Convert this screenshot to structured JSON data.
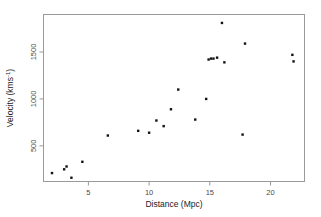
{
  "figure": {
    "background_color": "#ffffff",
    "frame_color": "#9a9a9a",
    "point_color": "#121212"
  },
  "axes": {
    "x_title": "Distance (Mpc)",
    "y_title": "Velocity (kms",
    "y_title_exponent": "-1",
    "y_title_close": ")",
    "x_ticks": [
      "5",
      "10",
      "15",
      "20"
    ],
    "y_ticks": [
      "500",
      "1000",
      "1500"
    ]
  },
  "chart_data": {
    "type": "scatter",
    "title": "",
    "xlabel": "Distance (Mpc)",
    "ylabel": "Velocity (kms^-1)",
    "xlim": [
      1.3,
      22.8
    ],
    "ylim": [
      120,
      1900
    ],
    "xticks": [
      5,
      10,
      15,
      20
    ],
    "yticks": [
      500,
      1000,
      1500
    ],
    "grid": false,
    "legend": false,
    "marker": "square",
    "marker_size": 2.4,
    "n_points": 24,
    "x": [
      2.0,
      3.0,
      3.2,
      3.6,
      4.5,
      6.6,
      9.1,
      10.0,
      10.6,
      11.2,
      11.8,
      12.4,
      13.8,
      14.7,
      14.9,
      15.1,
      15.6,
      16.0,
      16.2,
      17.7,
      17.9,
      21.8,
      21.9,
      15.3
    ],
    "y": [
      210,
      250,
      280,
      160,
      330,
      610,
      660,
      640,
      770,
      710,
      890,
      1100,
      780,
      1000,
      1420,
      1430,
      1440,
      1810,
      1390,
      620,
      1590,
      1470,
      1400,
      1430
    ],
    "series": [
      {
        "name": "galaxies",
        "points": [
          {
            "x": 2.0,
            "y": 210
          },
          {
            "x": 3.0,
            "y": 250
          },
          {
            "x": 3.2,
            "y": 280
          },
          {
            "x": 3.6,
            "y": 160
          },
          {
            "x": 4.5,
            "y": 330
          },
          {
            "x": 6.6,
            "y": 610
          },
          {
            "x": 9.1,
            "y": 660
          },
          {
            "x": 10.0,
            "y": 640
          },
          {
            "x": 10.6,
            "y": 770
          },
          {
            "x": 11.2,
            "y": 710
          },
          {
            "x": 11.8,
            "y": 890
          },
          {
            "x": 12.4,
            "y": 1100
          },
          {
            "x": 13.8,
            "y": 780
          },
          {
            "x": 14.7,
            "y": 1000
          },
          {
            "x": 14.9,
            "y": 1420
          },
          {
            "x": 15.1,
            "y": 1430
          },
          {
            "x": 15.3,
            "y": 1430
          },
          {
            "x": 15.6,
            "y": 1440
          },
          {
            "x": 16.0,
            "y": 1810
          },
          {
            "x": 16.2,
            "y": 1390
          },
          {
            "x": 17.7,
            "y": 620
          },
          {
            "x": 17.9,
            "y": 1590
          },
          {
            "x": 21.8,
            "y": 1470
          },
          {
            "x": 21.9,
            "y": 1400
          }
        ]
      }
    ]
  }
}
